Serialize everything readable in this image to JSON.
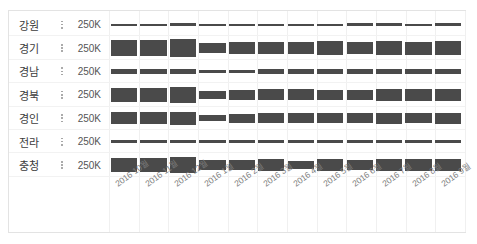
{
  "chart_data": {
    "type": "bar",
    "title": "",
    "xlabel": "",
    "ylabel": "",
    "ylim": [
      0,
      250000
    ],
    "axis_max_label": "250K",
    "grid": true,
    "legend": "none",
    "orientation": "row-bands",
    "categories": [
      "2016 10월",
      "2016 11월",
      "2016 12월",
      "2016 1월",
      "2016 2월",
      "2016 3월",
      "2016 4월",
      "2016 5월",
      "2016 6월",
      "2016 7월",
      "2016 8월",
      "2016 9월"
    ],
    "series": [
      {
        "name": "강원",
        "values": [
          22000,
          22000,
          24000,
          22000,
          20000,
          22000,
          23000,
          23000,
          24000,
          24000,
          23000,
          24000
        ]
      },
      {
        "name": "경기",
        "values": [
          150000,
          155000,
          170000,
          95000,
          110000,
          120000,
          115000,
          128000,
          120000,
          135000,
          125000,
          130000
        ]
      },
      {
        "name": "경남",
        "values": [
          45000,
          48000,
          52000,
          30000,
          33000,
          42000,
          44000,
          40000,
          42000,
          44000,
          45000,
          44000
        ]
      },
      {
        "name": "경북",
        "values": [
          130000,
          132000,
          150000,
          82000,
          92000,
          108000,
          105000,
          98000,
          100000,
          118000,
          112000,
          118000
        ]
      },
      {
        "name": "경인",
        "values": [
          112000,
          118000,
          130000,
          62000,
          88000,
          100000,
          98000,
          92000,
          95000,
          108000,
          100000,
          105000
        ]
      },
      {
        "name": "전라",
        "values": [
          30000,
          28000,
          30000,
          28000,
          27000,
          29000,
          30000,
          30000,
          31000,
          30000,
          30000,
          31000
        ]
      },
      {
        "name": "충청",
        "values": [
          140000,
          142000,
          158000,
          88000,
          95000,
          112000,
          78000,
          118000,
          105000,
          115000,
          120000,
          122000
        ]
      }
    ]
  },
  "rows": [
    {
      "label": "강원",
      "axis_max": "250K",
      "menu": "row-menu"
    },
    {
      "label": "경기",
      "axis_max": "250K",
      "menu": "row-menu"
    },
    {
      "label": "경남",
      "axis_max": "250K",
      "menu": "row-menu"
    },
    {
      "label": "경북",
      "axis_max": "250K",
      "menu": "row-menu"
    },
    {
      "label": "경인",
      "axis_max": "250K",
      "menu": "row-menu"
    },
    {
      "label": "전라",
      "axis_max": "250K",
      "menu": "row-menu"
    },
    {
      "label": "충청",
      "axis_max": "250K",
      "menu": "row-menu"
    }
  ],
  "colors": {
    "bar": "#4a4a4a",
    "panel_border": "#e3e3e3",
    "gridline": "#f0f0f0",
    "row_separator": "#f2f2f2",
    "label_text": "#3c3c3c",
    "axis_text": "#7d7d7d"
  }
}
